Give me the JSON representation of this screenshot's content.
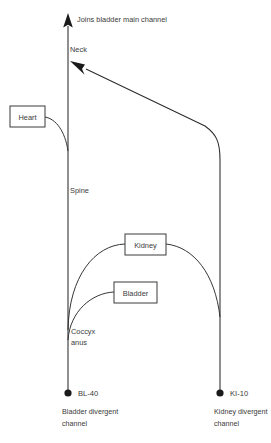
{
  "diagram": {
    "stroke_color": "#2b2b2b",
    "text_color": "#3a3a3a",
    "background_color": "#ffffff",
    "labels": {
      "top": "Joins bladder main channel",
      "neck": "Neck",
      "spine": "Spine",
      "coccyx": "Coccyx",
      "anus": "anus"
    },
    "boxes": [
      {
        "id": "heart",
        "label": "Heart"
      },
      {
        "id": "kidney",
        "label": "Kidney"
      },
      {
        "id": "bladder",
        "label": "Bladder"
      }
    ],
    "endpoints": [
      {
        "id": "bl40",
        "point_code": "BL-40",
        "caption_line1": "Bladder divergent",
        "caption_line2": "channel"
      },
      {
        "id": "ki10",
        "point_code": "KI-10",
        "caption_line1": "Kidney divergent",
        "caption_line2": "channel"
      }
    ]
  }
}
